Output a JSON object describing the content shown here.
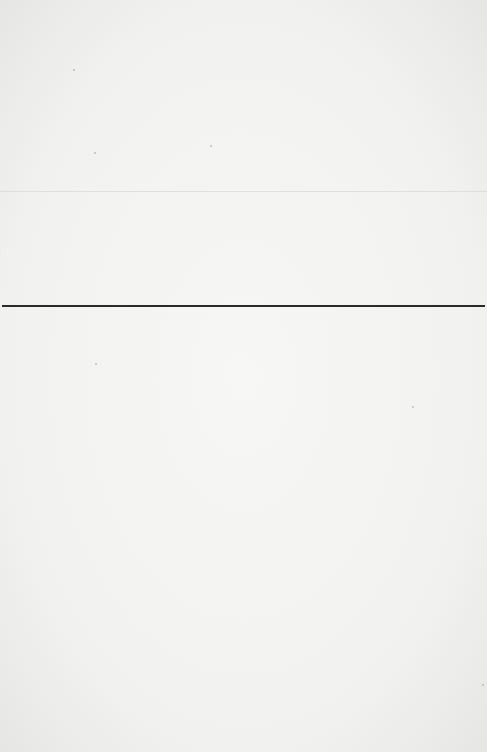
{
  "page": {
    "type": "blank-scanned-page",
    "background_color": "#f2f2f1",
    "rule": {
      "color": "#2a2a2a",
      "y": 306
    },
    "fold_line": {
      "y": 191
    }
  }
}
